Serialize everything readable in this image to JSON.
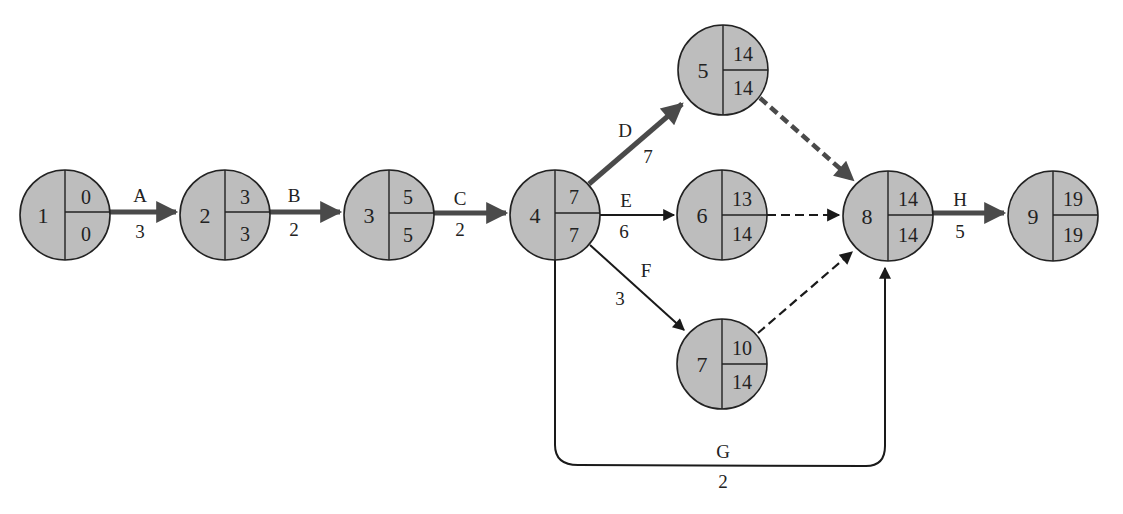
{
  "diagram": {
    "type": "activity-on-arrow network (CPM)",
    "colors": {
      "node_fill": "#bdbdbd",
      "critical_edge": "#4a4a4a",
      "normal_edge": "#1a1a1a"
    },
    "nodes": [
      {
        "id": "1",
        "earliest": "0",
        "latest": "0"
      },
      {
        "id": "2",
        "earliest": "3",
        "latest": "3"
      },
      {
        "id": "3",
        "earliest": "5",
        "latest": "5"
      },
      {
        "id": "4",
        "earliest": "7",
        "latest": "7"
      },
      {
        "id": "5",
        "earliest": "14",
        "latest": "14"
      },
      {
        "id": "6",
        "earliest": "13",
        "latest": "14"
      },
      {
        "id": "7",
        "earliest": "10",
        "latest": "14"
      },
      {
        "id": "8",
        "earliest": "14",
        "latest": "14"
      },
      {
        "id": "9",
        "earliest": "19",
        "latest": "19"
      }
    ],
    "edges": [
      {
        "activity": "A",
        "duration": "3",
        "from": "1",
        "to": "2",
        "critical": true
      },
      {
        "activity": "B",
        "duration": "2",
        "from": "2",
        "to": "3",
        "critical": true
      },
      {
        "activity": "C",
        "duration": "2",
        "from": "3",
        "to": "4",
        "critical": true
      },
      {
        "activity": "D",
        "duration": "7",
        "from": "4",
        "to": "5",
        "critical": true
      },
      {
        "activity": "E",
        "duration": "6",
        "from": "4",
        "to": "6",
        "critical": false
      },
      {
        "activity": "F",
        "duration": "3",
        "from": "4",
        "to": "7",
        "critical": false
      },
      {
        "activity": "G",
        "duration": "2",
        "from": "4",
        "to": "8",
        "critical": false
      },
      {
        "activity": "H",
        "duration": "5",
        "from": "8",
        "to": "9",
        "critical": true
      }
    ],
    "dummy_edges": [
      {
        "from": "5",
        "to": "8",
        "critical": true
      },
      {
        "from": "6",
        "to": "8",
        "critical": false
      },
      {
        "from": "7",
        "to": "8",
        "critical": false
      }
    ]
  }
}
